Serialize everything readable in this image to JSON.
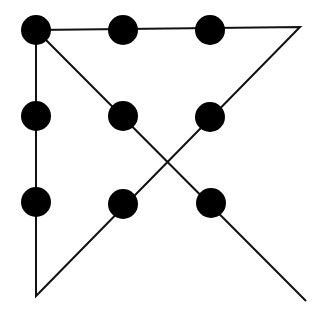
{
  "diagram": {
    "title": "",
    "background": "#ffffff",
    "dot_color": "#000000",
    "line_color": "#111111",
    "dot_radius": 15,
    "line_width": 2,
    "dots": [
      {
        "x": 36,
        "y": 30
      },
      {
        "x": 123,
        "y": 30
      },
      {
        "x": 210,
        "y": 30
      },
      {
        "x": 36,
        "y": 116
      },
      {
        "x": 123,
        "y": 116
      },
      {
        "x": 210,
        "y": 117
      },
      {
        "x": 36,
        "y": 202
      },
      {
        "x": 123,
        "y": 204
      },
      {
        "x": 211,
        "y": 203
      }
    ],
    "path": [
      {
        "x": 36,
        "y": 30
      },
      {
        "x": 300,
        "y": 27
      },
      {
        "x": 36,
        "y": 296
      },
      {
        "x": 36,
        "y": 30
      },
      {
        "x": 306,
        "y": 301
      }
    ]
  }
}
